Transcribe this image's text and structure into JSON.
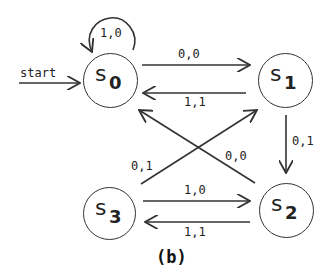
{
  "diagram": {
    "caption": "(b)",
    "start_label": "start",
    "states": [
      {
        "id": "s0",
        "letter": "s",
        "sub": "0"
      },
      {
        "id": "s1",
        "letter": "s",
        "sub": "1"
      },
      {
        "id": "s2",
        "letter": "s",
        "sub": "2"
      },
      {
        "id": "s3",
        "letter": "s",
        "sub": "3"
      }
    ],
    "transitions": [
      {
        "from": "s0",
        "to": "s0",
        "label": "1,0"
      },
      {
        "from": "s0",
        "to": "s1",
        "label": "0,0"
      },
      {
        "from": "s1",
        "to": "s0",
        "label": "1,1"
      },
      {
        "from": "s1",
        "to": "s2",
        "label": "0,1"
      },
      {
        "from": "s2",
        "to": "s0",
        "label": "0,0"
      },
      {
        "from": "s3",
        "to": "s1",
        "label": "0,1"
      },
      {
        "from": "s3",
        "to": "s2",
        "label": "1,0"
      },
      {
        "from": "s2",
        "to": "s3",
        "label": "1,1"
      }
    ],
    "colors": {
      "stroke": "#333333",
      "background": "#ffffff"
    }
  }
}
